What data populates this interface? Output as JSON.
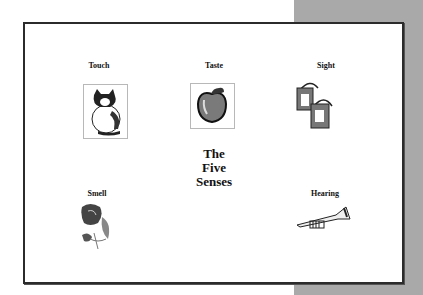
{
  "slide": {
    "title_lines": [
      "The",
      "Five",
      "Senses"
    ],
    "senses": [
      {
        "label": "Touch",
        "icon": "cat-icon"
      },
      {
        "label": "Taste",
        "icon": "apple-icon"
      },
      {
        "label": "Sight",
        "icon": "paint-cans-icon"
      },
      {
        "label": "Smell",
        "icon": "rose-icon"
      },
      {
        "label": "Hearing",
        "icon": "trumpet-icon"
      }
    ]
  },
  "colors": {
    "background": "#ffffff",
    "shade": "#a9a9a9",
    "border": "#2b2b2b"
  }
}
